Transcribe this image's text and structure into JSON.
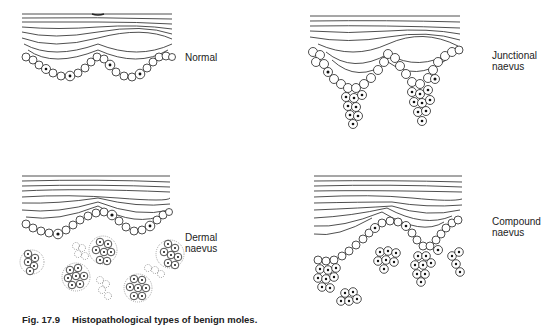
{
  "figure": {
    "caption_number": "Fig. 17.9",
    "caption_text": "Histopathological types of benign moles."
  },
  "panels": [
    {
      "id": "normal",
      "label_lines": [
        "Normal"
      ]
    },
    {
      "id": "junctional",
      "label_lines": [
        "Junctional",
        "naevus"
      ]
    },
    {
      "id": "dermal",
      "label_lines": [
        "Dermal",
        "naevus"
      ]
    },
    {
      "id": "compound",
      "label_lines": [
        "Compound",
        "naevus"
      ]
    }
  ],
  "colors": {
    "ink": "#222222",
    "background": "#ffffff"
  }
}
